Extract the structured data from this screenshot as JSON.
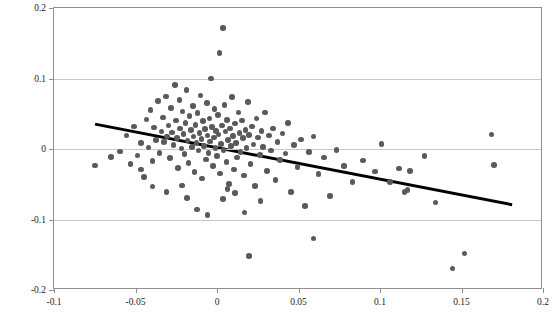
{
  "chart_data": {
    "type": "scatter",
    "title": "",
    "xlabel": "",
    "ylabel": "Decadal Change in Log Weekly Wage",
    "xlim": [
      -0.1,
      0.2
    ],
    "ylim": [
      -0.2,
      0.2
    ],
    "xticks": [
      -0.1,
      -0.05,
      0,
      0.05,
      0.1,
      0.15,
      0.2
    ],
    "xtick_labels": [
      "-0.1",
      "-0.05",
      "0",
      "0.05",
      "0.1",
      "0.15",
      "0.2"
    ],
    "yticks": [
      -0.2,
      -0.1,
      0,
      0.1,
      0.2
    ],
    "ytick_labels": [
      "-0.2",
      "-0.1",
      "0",
      "0.1",
      "0.2"
    ],
    "grid": "horizontal",
    "legend": "none",
    "marker_color": "#5a5a5a",
    "fit_line_color": "#000000",
    "grid_color": "#c8c8c8",
    "axis_color": "#8f8f8f",
    "fit_line": {
      "label": "linear fit",
      "x_start": -0.0747,
      "y_start": 0.0341,
      "x_end": 0.1822,
      "y_end": -0.081,
      "slope": -0.448,
      "intercept": 0.0006
    },
    "points": [
      [
        -0.0748,
        -0.0233
      ],
      [
        -0.0652,
        -0.0111
      ],
      [
        -0.0596,
        -0.0037
      ],
      [
        -0.0556,
        0.0191
      ],
      [
        -0.0531,
        -0.0215
      ],
      [
        -0.0509,
        0.0318
      ],
      [
        -0.0487,
        -0.0095
      ],
      [
        -0.0466,
        0.0082
      ],
      [
        -0.0449,
        -0.0401
      ],
      [
        -0.0432,
        0.0418
      ],
      [
        -0.0421,
        0.002
      ],
      [
        -0.0408,
        0.0552
      ],
      [
        -0.0396,
        -0.0172
      ],
      [
        -0.0386,
        0.0305
      ],
      [
        -0.0375,
        0.0128
      ],
      [
        -0.0362,
        0.0677
      ],
      [
        -0.0352,
        -0.0058
      ],
      [
        -0.0341,
        0.0248
      ],
      [
        -0.0333,
        0.0445
      ],
      [
        -0.0325,
        0.0099
      ],
      [
        -0.0313,
        0.0745
      ],
      [
        -0.0305,
        0.018
      ],
      [
        -0.0297,
        0.0331
      ],
      [
        -0.0289,
        -0.013
      ],
      [
        -0.0282,
        0.0583
      ],
      [
        -0.0275,
        0.0236
      ],
      [
        -0.0268,
        0.006
      ],
      [
        -0.0259,
        0.0904
      ],
      [
        -0.0252,
        0.0404
      ],
      [
        -0.0245,
        0.0155
      ],
      [
        -0.0238,
        -0.0268
      ],
      [
        -0.0231,
        0.0692
      ],
      [
        -0.0226,
        0.0289
      ],
      [
        -0.0219,
        0.0007
      ],
      [
        -0.0212,
        0.053
      ],
      [
        -0.0206,
        0.0211
      ],
      [
        -0.0199,
        -0.007
      ],
      [
        -0.0193,
        0.0366
      ],
      [
        -0.0186,
        0.0833
      ],
      [
        -0.018,
        0.0118
      ],
      [
        -0.0174,
        -0.0195
      ],
      [
        -0.0168,
        0.0468
      ],
      [
        -0.0161,
        0.0266
      ],
      [
        -0.0155,
        0.003
      ],
      [
        -0.0149,
        0.0609
      ],
      [
        -0.0143,
        0.0175
      ],
      [
        -0.0137,
        -0.033
      ],
      [
        -0.0131,
        0.0344
      ],
      [
        -0.0125,
        0.0088
      ],
      [
        -0.0119,
        0.0509
      ],
      [
        -0.0113,
        -0.0019
      ],
      [
        -0.0108,
        0.0228
      ],
      [
        -0.0102,
        0.0761
      ],
      [
        -0.0096,
        0.0142
      ],
      [
        -0.0091,
        -0.042
      ],
      [
        -0.0085,
        0.0395
      ],
      [
        -0.008,
        0.0046
      ],
      [
        -0.0074,
        0.0281
      ],
      [
        -0.0069,
        -0.0148
      ],
      [
        -0.0063,
        0.0655
      ],
      [
        -0.0058,
        0.0191
      ],
      [
        -0.0052,
        -0.0056
      ],
      [
        -0.0047,
        0.0433
      ],
      [
        -0.0042,
        0.0104
      ],
      [
        -0.0036,
        0.1001
      ],
      [
        -0.0031,
        0.0309
      ],
      [
        -0.0026,
        -0.024
      ],
      [
        -0.002,
        0.0166
      ],
      [
        -0.0015,
        0.0568
      ],
      [
        -0.001,
        0.0014
      ],
      [
        -0.0005,
        0.0253
      ],
      [
        0.0,
        -0.0099
      ],
      [
        0.0005,
        0.0481
      ],
      [
        0.001,
        0.0203
      ],
      [
        0.0015,
        0.1362
      ],
      [
        0.002,
        -0.035
      ],
      [
        0.0025,
        0.007
      ],
      [
        0.0031,
        0.0336
      ],
      [
        0.0036,
        0.1718
      ],
      [
        0.0041,
        -0.0015
      ],
      [
        0.0047,
        0.0624
      ],
      [
        0.0052,
        0.0246
      ],
      [
        0.0058,
        -0.0182
      ],
      [
        0.0063,
        0.0413
      ],
      [
        0.0069,
        0.013
      ],
      [
        0.0075,
        -0.0498
      ],
      [
        0.0081,
        0.0292
      ],
      [
        0.0087,
        0.0041
      ],
      [
        0.0093,
        0.0738
      ],
      [
        0.0099,
        0.0186
      ],
      [
        0.0105,
        -0.0288
      ],
      [
        0.0111,
        0.0363
      ],
      [
        0.0118,
        0.0087
      ],
      [
        0.0124,
        -0.0119
      ],
      [
        0.0131,
        0.052
      ],
      [
        0.0138,
        0.0229
      ],
      [
        0.0145,
        -0.0043
      ],
      [
        0.0152,
        0.0402
      ],
      [
        0.0159,
        0.0152
      ],
      [
        0.0166,
        -0.0378
      ],
      [
        0.0174,
        0.027
      ],
      [
        0.0182,
        0.0012
      ],
      [
        0.019,
        0.0667
      ],
      [
        0.0198,
        0.0201
      ],
      [
        0.0206,
        -0.0215
      ],
      [
        0.0215,
        0.0321
      ],
      [
        0.0224,
        0.0061
      ],
      [
        0.0233,
        -0.0528
      ],
      [
        0.0242,
        0.0433
      ],
      [
        0.0252,
        0.0166
      ],
      [
        0.0262,
        -0.0087
      ],
      [
        0.0272,
        0.0253
      ],
      [
        0.0283,
        0.0032
      ],
      [
        0.0294,
        0.0516
      ],
      [
        0.0306,
        -0.031
      ],
      [
        0.0318,
        0.0194
      ],
      [
        0.0331,
        -0.002
      ],
      [
        0.0344,
        0.0289
      ],
      [
        0.0358,
        -0.0443
      ],
      [
        0.0372,
        0.0101
      ],
      [
        0.0387,
        -0.0159
      ],
      [
        0.0403,
        0.0221
      ],
      [
        0.0419,
        -0.0063
      ],
      [
        0.0437,
        0.0366
      ],
      [
        0.0455,
        -0.061
      ],
      [
        0.0474,
        0.0055
      ],
      [
        0.0495,
        -0.0255
      ],
      [
        0.0517,
        0.0133
      ],
      [
        0.054,
        -0.0812
      ],
      [
        0.0566,
        -0.0044
      ],
      [
        0.0593,
        0.0179
      ],
      [
        0.0623,
        -0.0351
      ],
      [
        0.0656,
        -0.0119
      ],
      [
        0.0692,
        -0.0669
      ],
      [
        0.0733,
        -0.0012
      ],
      [
        0.0779,
        -0.0244
      ],
      [
        0.0832,
        -0.047
      ],
      [
        0.0894,
        -0.0164
      ],
      [
        0.0968,
        -0.0318
      ],
      [
        0.1008,
        0.0068
      ],
      [
        0.1063,
        -0.0471
      ],
      [
        0.1118,
        -0.0276
      ],
      [
        0.1151,
        -0.0608
      ],
      [
        0.1168,
        -0.0578
      ],
      [
        0.1184,
        -0.0311
      ],
      [
        0.1272,
        -0.0096
      ],
      [
        0.134,
        -0.0759
      ],
      [
        0.1444,
        -0.1695
      ],
      [
        0.1518,
        -0.1483
      ],
      [
        0.1684,
        0.0208
      ],
      [
        0.17,
        -0.0223
      ],
      [
        0.0196,
        -0.152
      ],
      [
        0.0593,
        -0.127
      ],
      [
        -0.031,
        -0.0612
      ],
      [
        -0.0183,
        -0.0694
      ],
      [
        -0.0123,
        -0.0858
      ],
      [
        -0.0059,
        -0.094
      ],
      [
        0.0035,
        -0.0708
      ],
      [
        0.011,
        -0.0624
      ],
      [
        0.0168,
        -0.09
      ],
      [
        -0.0396,
        -0.0531
      ],
      [
        -0.0466,
        -0.0288
      ],
      [
        -0.0213,
        -0.052
      ],
      [
        0.0268,
        -0.0735
      ],
      [
        0.0064,
        -0.0565
      ]
    ]
  }
}
